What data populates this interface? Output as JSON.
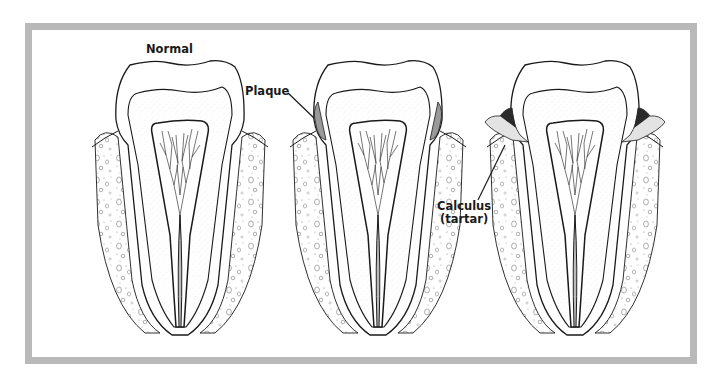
{
  "figure": {
    "frame_color": "#b9b9b9",
    "line_color": "#1a1a1a",
    "enamel_fill": "#ffffff",
    "dentin_fill": "#f4f4f4",
    "plaque_color": "#9a9a9a",
    "calculus_color": "#2a2a2a"
  },
  "panels": [
    {
      "id": "normal",
      "label": "Normal"
    },
    {
      "id": "plaque",
      "label": "Plaque"
    },
    {
      "id": "calculus",
      "label_line1": "Calculus",
      "label_line2": "(tartar)"
    }
  ]
}
